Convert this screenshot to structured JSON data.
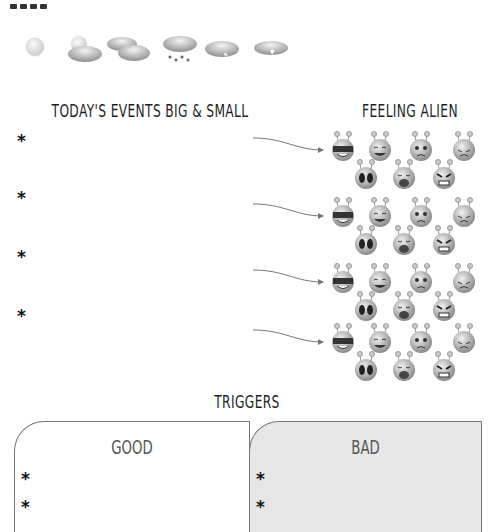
{
  "page": {
    "top_cut_label": "DATE"
  },
  "weather": {
    "icons": [
      "sun-icon",
      "partly-cloudy-icon",
      "cloudy-icon",
      "rain-icon",
      "snow-cloud-icon",
      "thunder-cloud-icon"
    ]
  },
  "events": {
    "title": "TODAY'S EVENTS BIG & SMALL",
    "bullet": "*",
    "items": [
      "*",
      "*",
      "*",
      "*"
    ]
  },
  "feelings": {
    "title": "FEELING ALIEN",
    "emotions": [
      "cool",
      "laughing",
      "worried",
      "sad",
      "scared",
      "crying",
      "angry"
    ]
  },
  "triggers": {
    "title": "TRIGGERS",
    "good": {
      "title": "GOOD",
      "items": [
        "*",
        "*"
      ]
    },
    "bad": {
      "title": "BAD",
      "items": [
        "*",
        "*"
      ]
    }
  },
  "colors": {
    "bad_fill": "#e7e7e7",
    "border": "#777777",
    "text": "#1e1e1e"
  }
}
